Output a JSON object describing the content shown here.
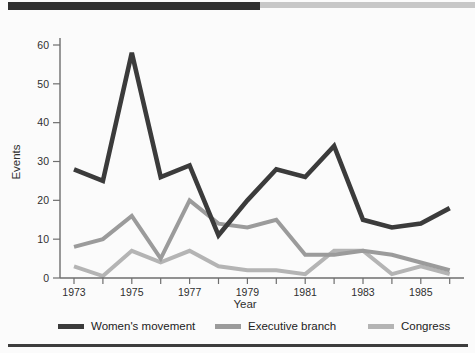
{
  "chart_data": {
    "type": "line",
    "title": "",
    "xlabel": "Year",
    "ylabel": "Events",
    "x": [
      1973,
      1974,
      1975,
      1976,
      1977,
      1978,
      1979,
      1980,
      1981,
      1982,
      1983,
      1984,
      1985,
      1986
    ],
    "xticks_labeled": [
      1973,
      1975,
      1977,
      1979,
      1981,
      1983,
      1985
    ],
    "yticks": [
      0,
      10,
      20,
      30,
      40,
      50,
      60
    ],
    "ylim": [
      0,
      60
    ],
    "grid": "off",
    "legend_position": "bottom",
    "series": [
      {
        "name": "Women's movement",
        "color": "#3b3b3b",
        "width": 4.6,
        "values": [
          28,
          25,
          58,
          26,
          29,
          11,
          20,
          28,
          26,
          34,
          15,
          13,
          14,
          18
        ]
      },
      {
        "name": "Executive branch",
        "color": "#9b9b9b",
        "width": 4,
        "values": [
          8,
          10,
          16,
          5,
          20,
          14,
          13,
          15,
          6,
          6,
          7,
          6,
          4,
          2
        ]
      },
      {
        "name": "Congress",
        "color": "#b4b4b4",
        "width": 4,
        "values": [
          3,
          0.5,
          7,
          4,
          7,
          3,
          2,
          2,
          1,
          7,
          7,
          1,
          3,
          1
        ]
      }
    ]
  }
}
